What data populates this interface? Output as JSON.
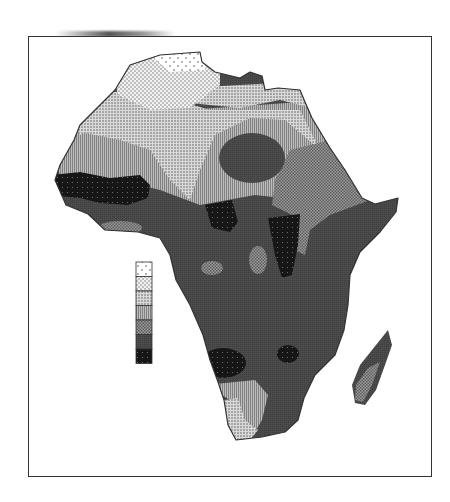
{
  "map": {
    "title": "",
    "subject": "Africa choropleth (grayscale, patterned classes)",
    "frame": {
      "x": 28,
      "y": 36,
      "width": 404,
      "height": 441
    },
    "legend": {
      "position": "inside-left",
      "x": 136,
      "y": 262,
      "swatch_w": 16,
      "swatch_h": 14.5,
      "labels": [],
      "classes": [
        {
          "id": 1,
          "pattern": "sparse-dots",
          "fill": "#ffffff",
          "dot": "#555555"
        },
        {
          "id": 2,
          "pattern": "dots",
          "fill": "#f0f0f0",
          "dot": "#555555"
        },
        {
          "id": 3,
          "pattern": "dense-dots",
          "fill": "#d9d9d9",
          "dot": "#444444"
        },
        {
          "id": 4,
          "pattern": "vertical-hatch",
          "fill": "#b0b0b0",
          "dot": "#6a6a6a"
        },
        {
          "id": 5,
          "pattern": "checker",
          "fill": "#8a8a8a",
          "dot": "#5a5a5a"
        },
        {
          "id": 6,
          "pattern": "dark-fine",
          "fill": "#4a4a4a",
          "dot": "#3a3a3a"
        },
        {
          "id": 7,
          "pattern": "black-dots",
          "fill": "#1a1a1a",
          "dot": "#666666"
        }
      ]
    },
    "colors": {
      "outline": "#333333",
      "background": "#ffffff"
    }
  }
}
